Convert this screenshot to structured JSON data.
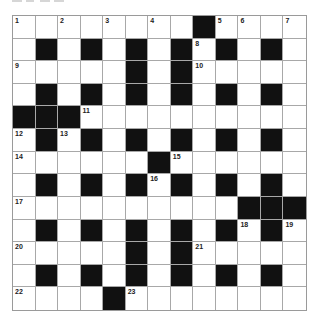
{
  "puzzle": {
    "rows": 13,
    "cols": 13,
    "colors": {
      "black": "#111111",
      "white": "#ffffff",
      "gridline": "#a8a8a8"
    },
    "layout": [
      "WWWWWWWWBWWWW",
      "WBWBWBWBWBWBW",
      "WWWWWBWBWWWWW",
      "WBWBWBWBWBWBW",
      "BBBWWWWWWWWWW",
      "WBWBWBWBWBWBW",
      "WWWWWWBWWWWWW",
      "WBWBWBWBWBWBW",
      "WWWWWWWWWWBBB",
      "WBWBWBWBWBWBW",
      "WWWWWBWBWWWWW",
      "WBWBWBWBWBWBW",
      "WWWWBWWWWWWWW"
    ],
    "numbers": [
      {
        "n": "1",
        "r": 0,
        "c": 0
      },
      {
        "n": "2",
        "r": 0,
        "c": 2
      },
      {
        "n": "3",
        "r": 0,
        "c": 4
      },
      {
        "n": "4",
        "r": 0,
        "c": 6
      },
      {
        "n": "5",
        "r": 0,
        "c": 9
      },
      {
        "n": "6",
        "r": 0,
        "c": 10
      },
      {
        "n": "7",
        "r": 0,
        "c": 12
      },
      {
        "n": "8",
        "r": 1,
        "c": 8
      },
      {
        "n": "9",
        "r": 2,
        "c": 0
      },
      {
        "n": "10",
        "r": 2,
        "c": 8
      },
      {
        "n": "11",
        "r": 4,
        "c": 3
      },
      {
        "n": "12",
        "r": 5,
        "c": 0
      },
      {
        "n": "13",
        "r": 5,
        "c": 2
      },
      {
        "n": "14",
        "r": 6,
        "c": 0
      },
      {
        "n": "15",
        "r": 6,
        "c": 7
      },
      {
        "n": "16",
        "r": 7,
        "c": 6
      },
      {
        "n": "17",
        "r": 8,
        "c": 0
      },
      {
        "n": "18",
        "r": 9,
        "c": 10
      },
      {
        "n": "19",
        "r": 9,
        "c": 12
      },
      {
        "n": "20",
        "r": 10,
        "c": 0
      },
      {
        "n": "21",
        "r": 10,
        "c": 8
      },
      {
        "n": "22",
        "r": 12,
        "c": 0
      },
      {
        "n": "23",
        "r": 12,
        "c": 5
      }
    ]
  }
}
